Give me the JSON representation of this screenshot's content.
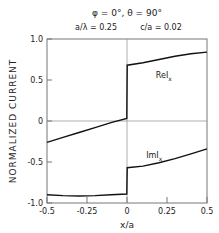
{
  "chart_data": {
    "type": "line",
    "title_line1": "φ = 0°,  θ = 90°",
    "title_line2_left": "a/λ = 0.25",
    "title_line2_right": "c/a = 0.02",
    "xlabel": "x/a",
    "ylabel": "NORMALIZED CURRENT",
    "xlim": [
      -0.5,
      0.5
    ],
    "ylim": [
      -1.0,
      1.0
    ],
    "xticks": [
      -0.5,
      -0.25,
      0,
      0.25,
      0.5
    ],
    "xtick_labels": [
      "-0.5",
      "-0.25",
      "0",
      "0.25",
      "0.5"
    ],
    "yticks": [
      1.0,
      0.5,
      0,
      -0.5,
      -1.0
    ],
    "ytick_labels": [
      "1.0",
      "0.5",
      "0",
      "-0.5",
      "-1.0"
    ],
    "grid": false,
    "reference_lines": {
      "x": 0,
      "y": 0
    },
    "series": [
      {
        "name": "ReI_x",
        "label_main": "ReI",
        "label_sub": "x",
        "x": [
          -0.5,
          -0.4,
          -0.3,
          -0.2,
          -0.1,
          -0.001,
          0.001,
          0.1,
          0.2,
          0.3,
          0.4,
          0.5
        ],
        "y": [
          -0.26,
          -0.2,
          -0.14,
          -0.08,
          -0.02,
          0.03,
          0.68,
          0.71,
          0.75,
          0.79,
          0.82,
          0.84
        ]
      },
      {
        "name": "ImI_x",
        "label_main": "ImI",
        "label_sub": "x",
        "x": [
          -0.5,
          -0.4,
          -0.3,
          -0.2,
          -0.1,
          -0.001,
          0.001,
          0.1,
          0.2,
          0.3,
          0.4,
          0.5
        ],
        "y": [
          -0.9,
          -0.91,
          -0.915,
          -0.91,
          -0.9,
          -0.89,
          -0.57,
          -0.55,
          -0.51,
          -0.46,
          -0.4,
          -0.34
        ]
      }
    ]
  }
}
